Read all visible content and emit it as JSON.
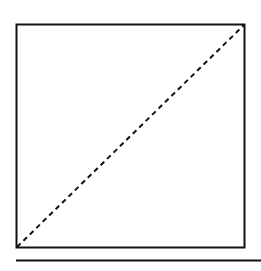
{
  "diagram": {
    "type": "square-with-diagonal",
    "box": {
      "x": 16.5,
      "y": 24.5,
      "width": 228,
      "height": 223
    },
    "diagonal": {
      "x1": 17,
      "y1": 247,
      "x2": 244,
      "y2": 25,
      "style": "dashed"
    },
    "rule": {
      "x1": 16,
      "y1": 260.5,
      "x2": 261,
      "y2": 260.5
    },
    "colors": {
      "stroke": "#111111",
      "background": "#ffffff"
    }
  }
}
